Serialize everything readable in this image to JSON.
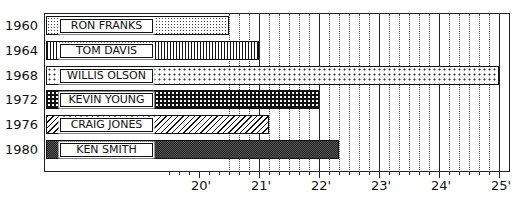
{
  "chart_data": {
    "type": "bar",
    "orientation": "horizontal",
    "title": "",
    "xlabel": "",
    "ylabel": "",
    "categories": [
      "1960",
      "1964",
      "1968",
      "1972",
      "1976",
      "1980"
    ],
    "labels": [
      "RON FRANKS",
      "TOM DAVIS",
      "WILLIS OLSON",
      "KEVIN YOUNG",
      "CRAIG JONES",
      "KEN SMITH"
    ],
    "values": [
      20.5,
      21.0,
      25.0,
      22.0,
      21.17,
      22.33
    ],
    "units": "feet",
    "xticks": [
      "20'",
      "21'",
      "22'",
      "23'",
      "24'",
      "25'"
    ],
    "xlim": [
      17.9,
      25.2
    ],
    "grid": "vertical dotted minor (2\" steps) and solid major (1') lines",
    "legend": "none"
  },
  "axis": {
    "px_per_foot": 60,
    "origin_ft": 20,
    "origin_px": 199
  }
}
